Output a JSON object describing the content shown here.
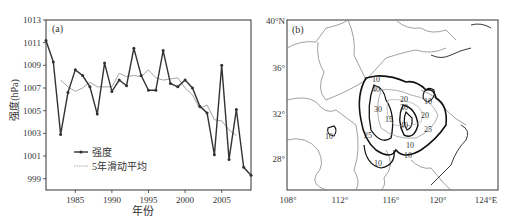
{
  "chart_data": [
    {
      "type": "line",
      "panel_label": "(a)",
      "title": "",
      "xlabel": "年份",
      "ylabel": "强度(hPa)",
      "xlim": [
        1981,
        2009
      ],
      "ylim": [
        998,
        1013
      ],
      "xticks": [
        1985,
        1990,
        1995,
        2000,
        2005
      ],
      "xtick_labels": [
        "1985",
        "1990",
        "1995",
        "2000",
        "2005"
      ],
      "yticks": [
        999,
        1001,
        1003,
        1005,
        1007,
        1009,
        1011,
        1013
      ],
      "ytick_labels": [
        "999",
        "1001",
        "1003",
        "1005",
        "1007",
        "1009",
        "1011",
        "1013"
      ],
      "grid": false,
      "legend_position": "bottom-left",
      "x": [
        1981,
        1982,
        1983,
        1984,
        1985,
        1986,
        1987,
        1988,
        1989,
        1990,
        1991,
        1992,
        1993,
        1994,
        1995,
        1996,
        1997,
        1998,
        1999,
        2000,
        2001,
        2002,
        2003,
        2004,
        2005,
        2006,
        2007,
        2008,
        2009
      ],
      "series": [
        {
          "name": "强度",
          "style": "solid-with-markers",
          "color": "#333333",
          "values": [
            1011.2,
            1009.3,
            1002.9,
            1006.6,
            1008.6,
            1008.1,
            1007.1,
            1004.7,
            1009.2,
            1006.7,
            1007.7,
            1007.2,
            1010.5,
            1008.1,
            1006.8,
            1006.8,
            1010.3,
            1007.4,
            1007.1,
            1007.7,
            1007.0,
            1005.4,
            1004.8,
            1001.1,
            1009.0,
            1000.7,
            1005.1,
            1000.0,
            999.3
          ]
        },
        {
          "name": "5年滑动平均",
          "style": "thin-gray",
          "color": "#999999",
          "x": [
            1983,
            1984,
            1985,
            1986,
            1987,
            1988,
            1989,
            1990,
            1991,
            1992,
            1993,
            1994,
            1995,
            1996,
            1997,
            1998,
            1999,
            2000,
            2001,
            2002,
            2003,
            2004,
            2005,
            2006,
            2007
          ],
          "values": [
            1007.7,
            1007.1,
            1006.7,
            1007.0,
            1007.5,
            1007.1,
            1007.1,
            1007.1,
            1008.3,
            1008.0,
            1008.1,
            1008.0,
            1008.6,
            1007.9,
            1007.7,
            1007.8,
            1007.9,
            1007.0,
            1006.4,
            1005.2,
            1005.5,
            1004.2,
            1004.1,
            1003.3,
            1002.8
          ]
        }
      ]
    },
    {
      "type": "map-contour",
      "panel_label": "(b)",
      "lon_ticks": [
        "108°",
        "112°",
        "116°",
        "120°",
        "124°E"
      ],
      "lat_ticks": [
        "28°",
        "32°",
        "36°",
        "40°N"
      ],
      "contour_labels": [
        "10",
        "10",
        "10",
        "10",
        "15",
        "20",
        "25",
        "25",
        "30",
        "30",
        "40",
        "40",
        "10",
        "10",
        "20"
      ]
    }
  ]
}
